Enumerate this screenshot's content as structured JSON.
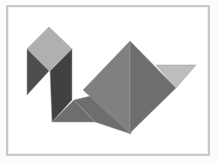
{
  "figure": {
    "kind": "tangram-silhouette",
    "subject_label": "bird",
    "background_color": "#ffffff",
    "outer_background_color": "#fcfcfc",
    "frame": {
      "border_color": "#c9c9c9",
      "border_width_px": 2,
      "inner_hairline_color": "#f2f2f2",
      "x": 6,
      "y": 5,
      "width": 204,
      "height": 151
    },
    "palette": {
      "light_gray": "#b0b0b0",
      "lighter_gray": "#bdbdbd",
      "medium_gray": "#808080",
      "medium_dark_gray": "#6e6e6e",
      "dark_gray": "#4d4d4d",
      "darker_gray": "#414141",
      "outline": "#9a9a9a"
    },
    "piece_count": 7,
    "pieces": [
      {
        "name": "head-square",
        "shape": "square",
        "fill": "#b0b0b0",
        "stroke": "#9a9a9a",
        "points": "49,27 72,49 49,71 27,49"
      },
      {
        "name": "neck-left-triangle",
        "shape": "triangle",
        "fill": "#4d4d4d",
        "stroke": "#9a9a9a",
        "points": "27,49 49,71 27,95"
      },
      {
        "name": "neck-right-parallelogram",
        "shape": "parallelogram",
        "fill": "#414141",
        "stroke": "#9a9a9a",
        "points": "72,49 72,100 52,122 50,71"
      },
      {
        "name": "breast-small-triangle",
        "shape": "triangle",
        "fill": "#6e6e6e",
        "stroke": "#9a9a9a",
        "points": "52,122 95,122 74,100"
      },
      {
        "name": "body-lower-triangle",
        "shape": "triangle",
        "fill": "#6e6e6e",
        "stroke": "#9a9a9a",
        "points": "74,100 95,122 131,134 131,86"
      },
      {
        "name": "body-left-large-triangle",
        "shape": "triangle",
        "fill": "#808080",
        "stroke": "#9a9a9a",
        "points": "130,41 130,133 83,90"
      },
      {
        "name": "body-right-large-triangle",
        "shape": "triangle",
        "fill": "#6e6e6e",
        "stroke": "#9a9a9a",
        "points": "130,41 176,88 130,133"
      },
      {
        "name": "tail-triangle",
        "shape": "triangle",
        "fill": "#bdbdbd",
        "stroke": "#9a9a9a",
        "points": "156,65 196,65 176,88"
      }
    ]
  }
}
